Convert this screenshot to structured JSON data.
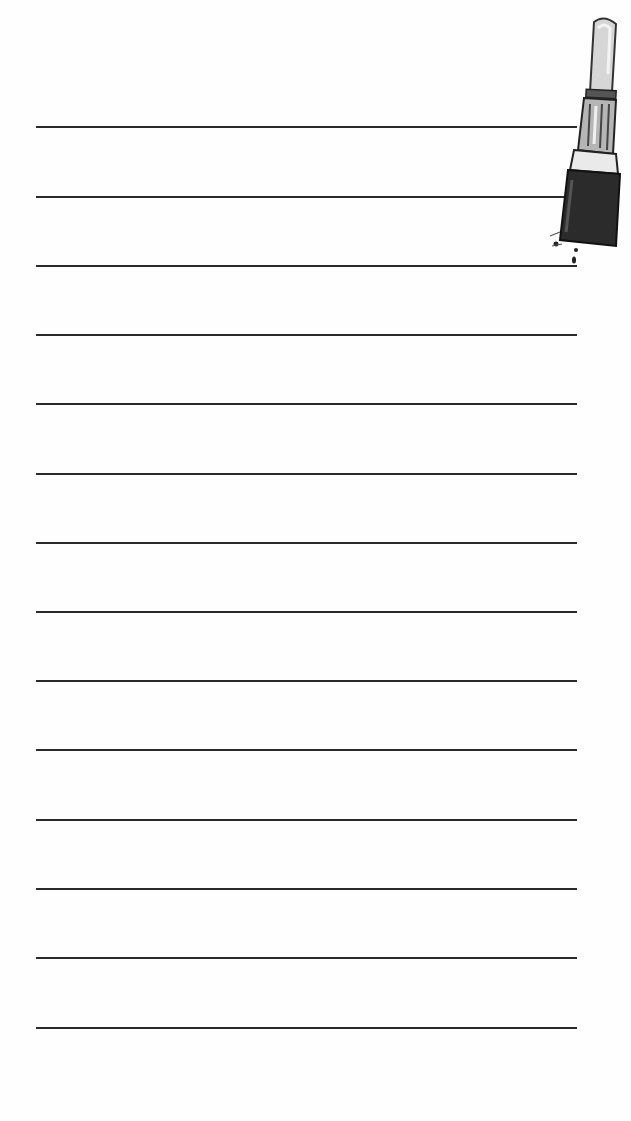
{
  "page": {
    "type": "lined notepad",
    "background": "#fefefe",
    "line_color": "#2a2a2a",
    "line_count": 14,
    "lines": [
      {
        "y": 127
      },
      {
        "y": 197
      },
      {
        "y": 266
      },
      {
        "y": 335
      },
      {
        "y": 404
      },
      {
        "y": 474
      },
      {
        "y": 543
      },
      {
        "y": 612
      },
      {
        "y": 681
      },
      {
        "y": 750
      },
      {
        "y": 820
      },
      {
        "y": 889
      },
      {
        "y": 958
      },
      {
        "y": 1028
      }
    ]
  },
  "decoration": {
    "icon": "lipstick-icon",
    "colors": {
      "bullet": "#d9d9d9",
      "tube_metal": "#6a6a6a",
      "case": "#2b2b2b"
    }
  }
}
